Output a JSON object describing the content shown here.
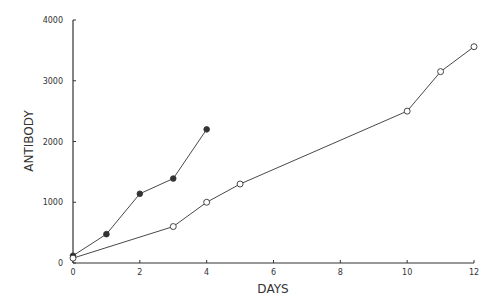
{
  "chart_data": {
    "type": "line",
    "title": "",
    "xlabel": "DAYS",
    "ylabel": "ANTIBODY",
    "xlim": [
      0,
      12
    ],
    "ylim": [
      0,
      4000
    ],
    "x_ticks": [
      0,
      2,
      4,
      6,
      8,
      10,
      12
    ],
    "y_ticks": [
      0,
      1000,
      2000,
      3000,
      4000
    ],
    "grid": false,
    "legend": null,
    "series": [
      {
        "name": "filled circles",
        "marker": "filled-circle",
        "x": [
          0,
          1,
          2,
          3,
          4
        ],
        "y": [
          120,
          475,
          1140,
          1390,
          2200
        ]
      },
      {
        "name": "open circles",
        "marker": "open-circle",
        "x": [
          0,
          3,
          4,
          5,
          10,
          11,
          12
        ],
        "y": [
          80,
          600,
          1000,
          1300,
          2500,
          3150,
          3560
        ]
      }
    ]
  },
  "colors": {
    "line": "#333333",
    "background": "#ffffff"
  }
}
